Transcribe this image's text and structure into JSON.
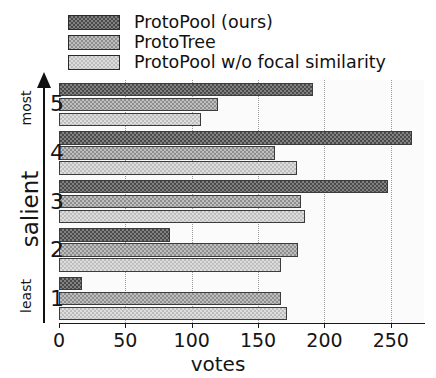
{
  "chart_data": {
    "type": "bar",
    "orientation": "horizontal",
    "title": "",
    "xlabel": "votes",
    "ylabel": "salient",
    "categories": [
      "1",
      "2",
      "3",
      "4",
      "5"
    ],
    "ylim_low_label": "least",
    "ylim_high_label": "most",
    "xlim": [
      0,
      275
    ],
    "xticks": [
      0,
      50,
      100,
      150,
      200,
      250
    ],
    "xtick_labels": [
      "0",
      "50",
      "100",
      "150",
      "200",
      "250"
    ],
    "grid": true,
    "legend_position": "above-axes",
    "series": [
      {
        "name": "ProtoPool (ours)",
        "color": "#4a4a4a",
        "values": [
          17,
          84,
          248,
          266,
          191
        ]
      },
      {
        "name": "ProtoTree",
        "color": "#8f8f8f",
        "values": [
          167,
          180,
          182,
          163,
          120
        ]
      },
      {
        "name": "ProtoPool w/o focal similarity",
        "color": "#bdbdbd",
        "values": [
          172,
          167,
          185,
          179,
          107
        ]
      }
    ]
  },
  "legend": {
    "items": [
      {
        "label": "ProtoPool (ours)",
        "swatch": "dark-hatch-swatch"
      },
      {
        "label": "ProtoTree",
        "swatch": "medium-hatch-swatch"
      },
      {
        "label": "ProtoPool w/o focal similarity",
        "swatch": "light-hatch-swatch"
      }
    ]
  },
  "axis": {
    "x_label": "votes",
    "y_label": "salient",
    "y_high": "most",
    "y_low": "least"
  }
}
